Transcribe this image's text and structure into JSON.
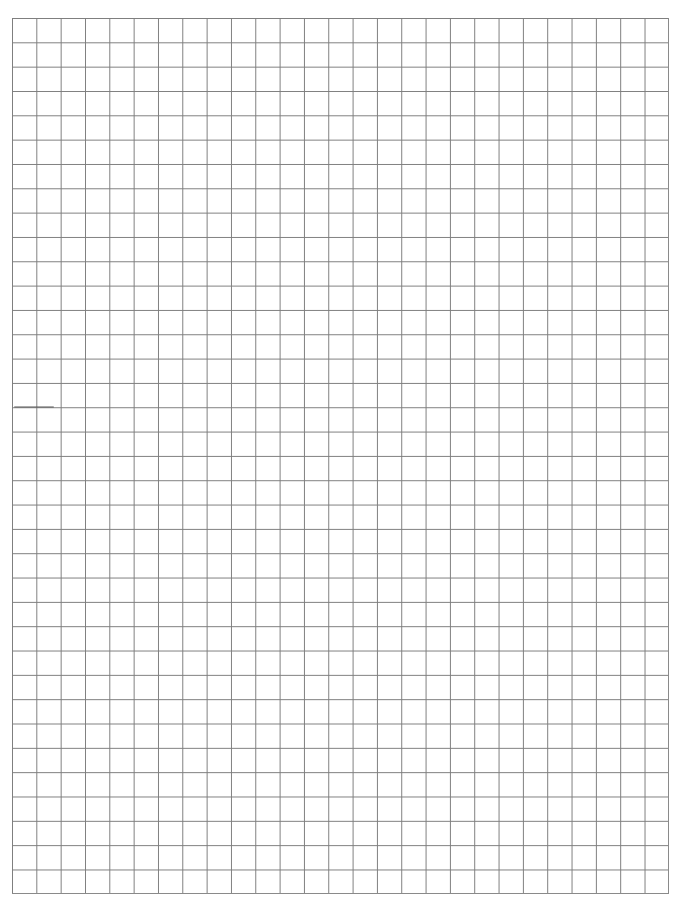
{
  "page": {
    "type": "graph-paper",
    "grid": {
      "columns": 27,
      "rows": 36,
      "line_color": "#7d7d7d",
      "background_color": "#ffffff"
    }
  }
}
